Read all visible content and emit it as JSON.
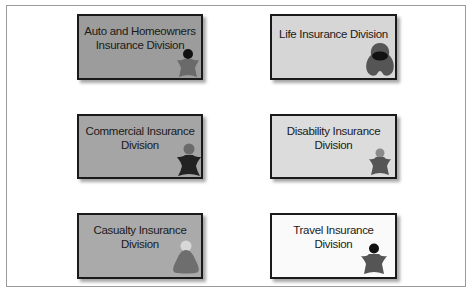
{
  "diagram": {
    "divisions": [
      {
        "id": "auto-homeowners",
        "label_line1": "Auto and Homeowners",
        "label_line2": "Insurance Division",
        "fill": "#9c9c9c",
        "icon": "person-star-icon",
        "icon_head_color": "#111111",
        "icon_body_color": "#6a6a6a",
        "column": "left",
        "row": 1
      },
      {
        "id": "life",
        "label_line1": "Life Insurance Division",
        "label_line2": "",
        "fill": "#d6d6d6",
        "icon": "hooded-figure-icon",
        "icon_head_color": "#111111",
        "icon_body_color": "#555555",
        "column": "right",
        "row": 1
      },
      {
        "id": "commercial",
        "label_line1": "Commercial Insurance",
        "label_line2": "Division",
        "fill": "#a5a5a5",
        "icon": "person-star-icon",
        "icon_head_color": "#6a6a6a",
        "icon_body_color": "#222222",
        "column": "left",
        "row": 2
      },
      {
        "id": "disability",
        "label_line1": "Disability Insurance",
        "label_line2": "Division",
        "fill": "#dcdcdc",
        "icon": "person-star-icon",
        "icon_head_color": "#8a8a8a",
        "icon_body_color": "#555555",
        "column": "right",
        "row": 2
      },
      {
        "id": "casualty",
        "label_line1": "Casualty Insurance",
        "label_line2": "Division",
        "fill": "#aaaaaa",
        "icon": "cone-figure-icon",
        "icon_head_color": "#d8d8d8",
        "icon_body_color": "#6e6e6e",
        "column": "left",
        "row": 3
      },
      {
        "id": "travel",
        "label_line1": "Travel Insurance",
        "label_line2": "Division",
        "fill": "#fafafa",
        "icon": "person-star-icon",
        "icon_head_color": "#111111",
        "icon_body_color": "#555555",
        "column": "right",
        "row": 3
      }
    ],
    "frame_border_color": "#9a9a9a",
    "box_border_color": "#1a1a1a"
  }
}
